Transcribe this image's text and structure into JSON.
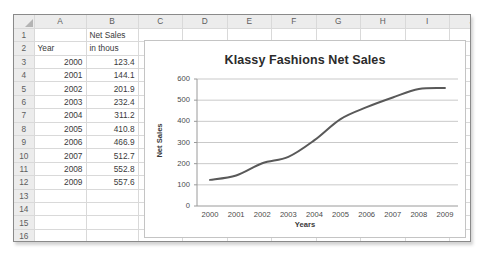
{
  "sheet": {
    "corner_icon": "select-all-icon",
    "columns": [
      "A",
      "B",
      "C",
      "D",
      "E",
      "F",
      "G",
      "H",
      "I",
      "J"
    ],
    "rows": [
      "1",
      "2",
      "3",
      "4",
      "5",
      "6",
      "7",
      "8",
      "9",
      "10",
      "11",
      "12",
      "13",
      "14",
      "15",
      "16"
    ],
    "cells": {
      "B1": "Net Sales",
      "A2": "Year",
      "B2": "in thous",
      "A3": "2000",
      "B3": "123.4",
      "A4": "2001",
      "B4": "144.1",
      "A5": "2002",
      "B5": "201.9",
      "A6": "2003",
      "B6": "232.4",
      "A7": "2004",
      "B7": "311.2",
      "A8": "2005",
      "B8": "410.8",
      "A9": "2006",
      "B9": "466.9",
      "A10": "2007",
      "B10": "512.7",
      "A11": "2008",
      "B11": "552.8",
      "A12": "2009",
      "B12": "557.6"
    }
  },
  "chart_data": {
    "type": "line",
    "title": "Klassy Fashions Net Sales",
    "xlabel": "Years",
    "ylabel": "Net Sales",
    "categories": [
      "2000",
      "2001",
      "2002",
      "2003",
      "2004",
      "2005",
      "2006",
      "2007",
      "2008",
      "2009"
    ],
    "values": [
      123.4,
      144.1,
      201.9,
      232.4,
      311.2,
      410.8,
      466.9,
      512.7,
      552.8,
      557.6
    ],
    "series": [
      {
        "name": "Net Sales in thous",
        "values": [
          123.4,
          144.1,
          201.9,
          232.4,
          311.2,
          410.8,
          466.9,
          512.7,
          552.8,
          557.6
        ]
      }
    ],
    "ylim": [
      0,
      600
    ],
    "yticks": [
      0,
      100,
      200,
      300,
      400,
      500,
      600
    ],
    "grid": "horizontal",
    "legend": "none",
    "line_color": "#595959",
    "markers": false,
    "smooth": true
  }
}
